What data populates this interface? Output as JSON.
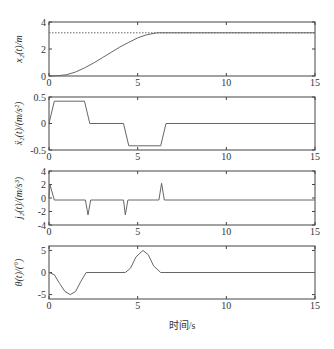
{
  "chart_data": [
    {
      "type": "line",
      "ylabel": "x₂(t)/m",
      "xlim": [
        0,
        15
      ],
      "ylim": [
        0,
        4
      ],
      "xticks": [
        "0",
        "5",
        "10",
        "15"
      ],
      "yticks": [
        "0",
        "2",
        "4"
      ],
      "series": [
        {
          "name": "x2",
          "style": "solid",
          "x": [
            0,
            0.5,
            1,
            1.5,
            2,
            2.5,
            3,
            3.5,
            4,
            4.5,
            5,
            5.5,
            6,
            6.2,
            15
          ],
          "y": [
            0,
            0.02,
            0.1,
            0.3,
            0.6,
            0.95,
            1.35,
            1.75,
            2.15,
            2.5,
            2.82,
            3.05,
            3.18,
            3.2,
            3.2
          ]
        },
        {
          "name": "target",
          "style": "dotted",
          "x": [
            0,
            15
          ],
          "y": [
            3.2,
            3.2
          ]
        }
      ]
    },
    {
      "type": "line",
      "ylabel": "ẍ₂(t)/(m/s²)",
      "xlim": [
        0,
        15
      ],
      "ylim": [
        -0.5,
        0.5
      ],
      "xticks": [
        "0",
        "5",
        "10",
        "15"
      ],
      "yticks": [
        "-0.5",
        "0",
        "0.5"
      ],
      "series": [
        {
          "name": "acc",
          "style": "solid",
          "x": [
            0,
            0.3,
            2.0,
            2.3,
            4.2,
            4.5,
            6.3,
            6.6,
            15
          ],
          "y": [
            0,
            0.42,
            0.42,
            0,
            0,
            -0.42,
            -0.42,
            0,
            0
          ]
        }
      ]
    },
    {
      "type": "line",
      "ylabel": "j₂(t)/(m/s³)",
      "xlim": [
        0,
        15
      ],
      "ylim": [
        -4,
        4
      ],
      "xticks": [
        "0",
        "5",
        "10",
        "15"
      ],
      "yticks": [
        "-4",
        "-2",
        "0",
        "2",
        "4"
      ],
      "series": [
        {
          "name": "jerk",
          "style": "solid",
          "x": [
            0,
            0.05,
            0.3,
            2.05,
            2.2,
            2.35,
            4.2,
            4.3,
            4.45,
            6.2,
            6.35,
            6.5,
            15
          ],
          "y": [
            0,
            2.0,
            -0.3,
            -0.3,
            -2.5,
            -0.3,
            -0.3,
            -2.5,
            -0.3,
            -0.3,
            2.2,
            -0.3,
            -0.3
          ]
        }
      ]
    },
    {
      "type": "line",
      "ylabel": "θ(t)/(°)",
      "xlabel": "时间/s",
      "xlim": [
        0,
        15
      ],
      "ylim": [
        -6,
        6
      ],
      "xticks": [
        "0",
        "5",
        "10",
        "15"
      ],
      "yticks": [
        "-5",
        "0",
        "5"
      ],
      "series": [
        {
          "name": "theta",
          "style": "solid",
          "x": [
            0,
            0.3,
            0.6,
            0.9,
            1.2,
            1.5,
            1.8,
            2.1,
            4.3,
            4.6,
            4.9,
            5.3,
            5.6,
            5.9,
            6.3,
            15
          ],
          "y": [
            0,
            -0.5,
            -2.5,
            -4.3,
            -5,
            -4.3,
            -2.0,
            0,
            0,
            1.0,
            3.5,
            5,
            4.0,
            1.5,
            0,
            0
          ]
        }
      ]
    }
  ],
  "figure": {
    "xlabel": "时间/s",
    "panels": [
      {
        "ylabel": "x₂(t)/m"
      },
      {
        "ylabel": "ẍ₂(t)/(m/s²)"
      },
      {
        "ylabel": "j₂(t)/(m/s³)"
      },
      {
        "ylabel": "θ(t)/(°)"
      }
    ]
  }
}
